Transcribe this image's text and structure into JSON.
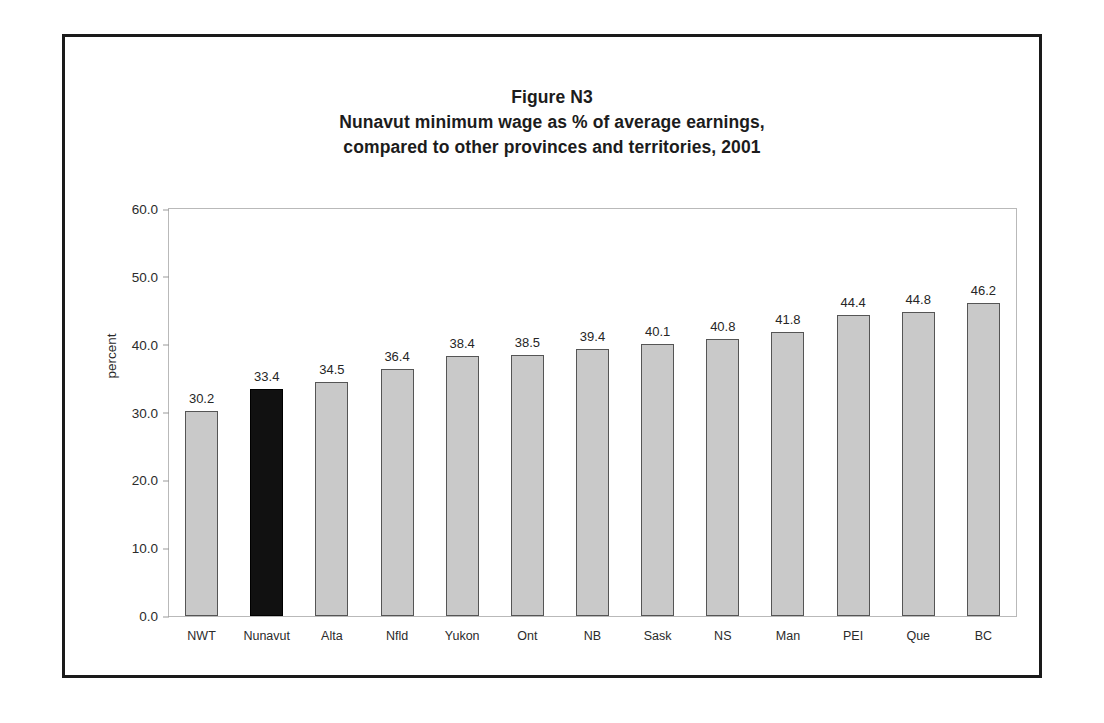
{
  "figure": {
    "title_lines": [
      "Figure N3",
      "Nunavut minimum wage as % of average earnings,",
      "compared to other provinces and territories, 2001"
    ]
  },
  "colors": {
    "bar_fill": "#c9c9c9",
    "bar_border": "#555555",
    "highlight_fill": "#111111",
    "frame": "#1a1a1a",
    "plot_border": "#b9b9b9",
    "text": "#262626"
  },
  "chart_data": {
    "type": "bar",
    "xlabel": "",
    "ylabel": "percent",
    "ylim": [
      0.0,
      60.0
    ],
    "ytick_labels": [
      "60.0",
      "50.0",
      "40.0",
      "30.0",
      "20.0",
      "10.0",
      "0.0"
    ],
    "yticks": [
      60.0,
      50.0,
      40.0,
      30.0,
      20.0,
      10.0,
      0.0
    ],
    "grid": false,
    "legend": "none",
    "highlight_category": "Nunavut",
    "categories": [
      "NWT",
      "Nunavut",
      "Alta",
      "Nfld",
      "Yukon",
      "Ont",
      "NB",
      "Sask",
      "NS",
      "Man",
      "PEI",
      "Que",
      "BC"
    ],
    "values": [
      30.2,
      33.4,
      34.5,
      36.4,
      38.4,
      38.5,
      39.4,
      40.1,
      40.8,
      41.8,
      44.4,
      44.8,
      46.2
    ],
    "value_labels": [
      "30.2",
      "33.4",
      "34.5",
      "36.4",
      "38.4",
      "38.5",
      "39.4",
      "40.1",
      "40.8",
      "41.8",
      "44.4",
      "44.8",
      "46.2"
    ]
  }
}
